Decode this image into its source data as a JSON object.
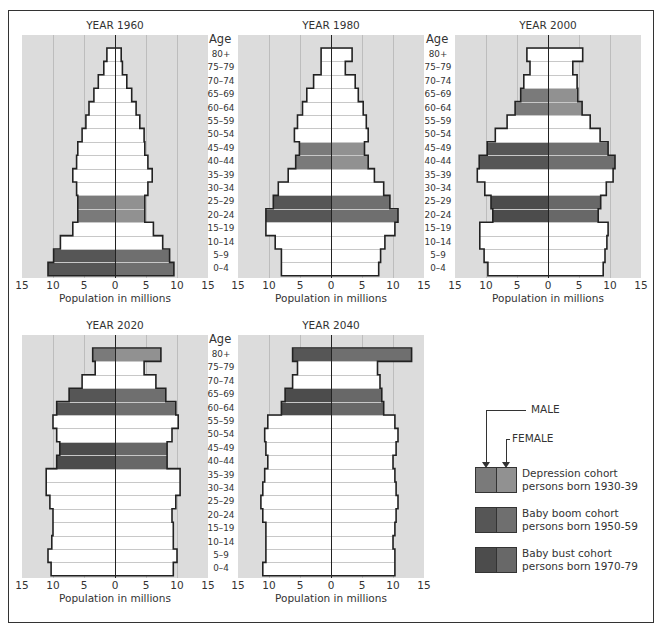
{
  "chart_data": {
    "type": "bar",
    "subtype": "population-pyramid",
    "xlabel": "Population in millions",
    "ylabel": "Age",
    "xlim": [
      -15,
      15
    ],
    "x_ticks": [
      "15",
      "10",
      "5",
      "0",
      "5",
      "10",
      "15"
    ],
    "grid": true,
    "age_groups": [
      "80+",
      "75-79",
      "70-74",
      "65-69",
      "60-64",
      "55-59",
      "50-54",
      "45-49",
      "40-44",
      "35-39",
      "30-34",
      "25-29",
      "20-24",
      "15-19",
      "10-14",
      "5-9",
      "0-4"
    ],
    "cohorts": [
      {
        "id": "depression",
        "label_line1": "Depression cohort",
        "label_line2": "persons born 1930-39",
        "male_color": "#7a7a7a",
        "female_color": "#919191"
      },
      {
        "id": "boom",
        "label_line1": "Baby boom cohort",
        "label_line2": "persons born 1950-59",
        "male_color": "#565656",
        "female_color": "#6f6f6f"
      },
      {
        "id": "bust",
        "label_line1": "Baby bust cohort",
        "label_line2": "persons born 1970-79",
        "male_color": "#4c4c4c",
        "female_color": "#686868"
      }
    ],
    "panels": [
      {
        "title": "YEAR 1960",
        "male": [
          1.3,
          1.8,
          2.7,
          3.4,
          4.2,
          4.7,
          5.3,
          6.0,
          6.2,
          6.8,
          6.2,
          6.0,
          6.0,
          6.8,
          8.8,
          9.9,
          10.8
        ],
        "female": [
          1.0,
          1.2,
          1.9,
          2.7,
          3.4,
          4.0,
          4.7,
          4.8,
          5.3,
          6.0,
          5.3,
          4.8,
          4.8,
          6.2,
          7.7,
          8.8,
          9.5
        ],
        "cohort_rows": {
          "11": "depression",
          "12": "depression",
          "15": "boom",
          "16": "boom"
        }
      },
      {
        "title": "YEAR 1980",
        "male": [
          1.6,
          1.6,
          2.8,
          3.9,
          4.6,
          5.4,
          5.9,
          5.1,
          5.7,
          6.9,
          8.5,
          9.3,
          10.5,
          10.5,
          9.0,
          8.0,
          8.0
        ],
        "female": [
          3.4,
          2.3,
          3.9,
          4.4,
          5.2,
          5.7,
          6.0,
          5.4,
          6.0,
          7.0,
          8.5,
          9.5,
          10.8,
          10.3,
          8.7,
          8.0,
          7.7
        ],
        "cohort_rows": {
          "7": "depression",
          "8": "depression",
          "11": "boom",
          "12": "boom"
        }
      },
      {
        "title": "YEAR 2000",
        "male": [
          3.4,
          2.9,
          3.9,
          4.4,
          5.3,
          6.6,
          8.5,
          9.8,
          11.1,
          11.4,
          10.2,
          9.2,
          8.9,
          11.0,
          11.0,
          10.3,
          9.7
        ],
        "female": [
          5.6,
          4.0,
          4.7,
          4.8,
          5.5,
          6.8,
          8.4,
          9.7,
          10.8,
          10.5,
          9.4,
          8.5,
          8.1,
          9.7,
          9.5,
          9.2,
          8.9
        ],
        "cohort_rows": {
          "3": "depression",
          "4": "depression",
          "7": "boom",
          "8": "boom",
          "11": "bust",
          "12": "bust"
        }
      },
      {
        "title": "YEAR 2020",
        "male": [
          3.6,
          3.2,
          5.3,
          7.4,
          9.4,
          10.0,
          9.4,
          8.9,
          9.4,
          11.1,
          11.1,
          10.5,
          10.0,
          10.0,
          10.2,
          10.8,
          10.3
        ],
        "female": [
          7.4,
          4.7,
          6.6,
          8.2,
          9.8,
          10.2,
          9.2,
          8.4,
          8.4,
          10.5,
          10.5,
          9.8,
          9.2,
          9.4,
          9.4,
          10.0,
          9.4
        ],
        "cohort_rows": {
          "0": "depression",
          "3": "boom",
          "4": "boom",
          "7": "bust",
          "8": "bust"
        }
      },
      {
        "title": "YEAR 2040",
        "male": [
          6.2,
          5.4,
          6.2,
          7.4,
          8.0,
          10.2,
          10.7,
          10.5,
          10.2,
          10.7,
          11.0,
          11.3,
          11.0,
          10.5,
          10.5,
          10.5,
          11.0
        ],
        "female": [
          13.0,
          7.5,
          7.9,
          8.2,
          8.5,
          10.3,
          10.8,
          10.5,
          10.0,
          10.3,
          10.5,
          10.8,
          10.5,
          10.3,
          10.0,
          10.3,
          10.3
        ],
        "cohort_rows": {
          "0": "boom",
          "3": "bust",
          "4": "bust"
        }
      }
    ]
  },
  "legend": {
    "male_label": "MALE",
    "female_label": "FEMALE"
  }
}
